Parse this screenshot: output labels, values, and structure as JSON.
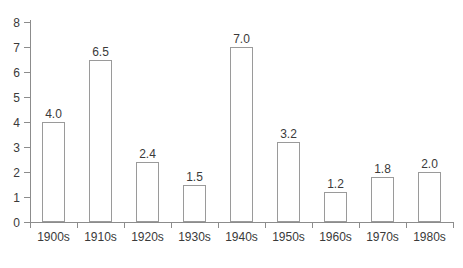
{
  "chart_data": {
    "type": "bar",
    "title": "",
    "subtitle": "",
    "xlabel": "",
    "ylabel": "",
    "categories": [
      "1900s",
      "1910s",
      "1920s",
      "1930s",
      "1940s",
      "1950s",
      "1960s",
      "1970s",
      "1980s"
    ],
    "values": [
      4.0,
      6.5,
      2.4,
      1.5,
      7.0,
      3.2,
      1.2,
      1.8,
      2.0
    ],
    "value_labels": [
      "4.0",
      "6.5",
      "2.4",
      "1.5",
      "7.0",
      "3.2",
      "1.2",
      "1.8",
      "2.0"
    ],
    "ylim": [
      0,
      8
    ],
    "y_ticks": [
      0,
      1,
      2,
      3,
      4,
      5,
      6,
      7,
      8
    ],
    "y_tick_labels": [
      "0",
      "1",
      "2",
      "3",
      "4",
      "5",
      "6",
      "7",
      "8"
    ],
    "grid": false,
    "legend": null,
    "legend_position": "none",
    "bar_fill_color": "#ffffff",
    "bar_edge_color": "#9a9a9a",
    "axis_color": "#8c8c8c",
    "text_color": "#3a3a3a",
    "background_color": "#ffffff"
  }
}
